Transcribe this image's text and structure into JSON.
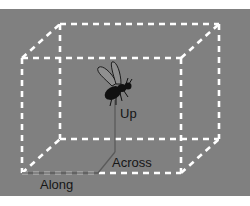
{
  "diagram": {
    "colors": {
      "background": "#808080",
      "cube_edges": "#ffffff",
      "axis_lines": "#5a5a5a",
      "fly": "#111111",
      "labels": "#161616"
    },
    "axes": [
      {
        "id": "along",
        "label": "Along"
      },
      {
        "id": "across",
        "label": "Across"
      },
      {
        "id": "up",
        "label": "Up"
      }
    ]
  }
}
